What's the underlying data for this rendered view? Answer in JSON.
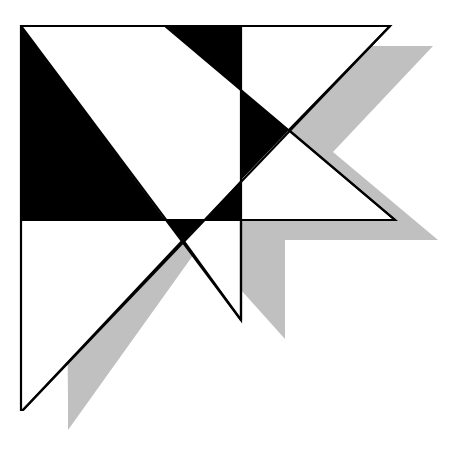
{
  "figure": {
    "width": 467,
    "height": 455,
    "colors": {
      "background": "#ffffff",
      "fill_black": "#000000",
      "shadow": "#c0c0c0",
      "stroke": "#000000"
    },
    "shadow_polygon": "65,46 433,46 333,152 438,240 285,240 285,339 241,290 241,240 204,240 68,430 68,400",
    "outline_polygon": "21,26 390,26 289,130 395,220 241,220 241,320 183,240 23,410 21,410",
    "black_regions": [
      {
        "name": "left-black-region",
        "points": "21,26 165,220 21,220"
      },
      {
        "name": "top-black-triangle",
        "points": "165,26 241,26 241,90"
      },
      {
        "name": "center-black-triangle",
        "points": "241,90 289,130 241,180"
      },
      {
        "name": "lower-black-triangle",
        "points": "241,180 241,220 204,220"
      },
      {
        "name": "bottom-black-bowtie",
        "points": "165,220 204,220 183,242"
      }
    ],
    "lines": [
      {
        "name": "horizontal-divider",
        "x1": 21,
        "y1": 220,
        "x2": 395,
        "y2": 220
      },
      {
        "name": "vertical-divider",
        "x1": 241,
        "y1": 26,
        "x2": 241,
        "y2": 320
      },
      {
        "name": "diagonal-left-down",
        "x1": 21,
        "y1": 26,
        "x2": 241,
        "y2": 320
      },
      {
        "name": "diagonal-long",
        "x1": 23,
        "y1": 410,
        "x2": 390,
        "y2": 26
      },
      {
        "name": "diagonal-top-right",
        "x1": 165,
        "y1": 26,
        "x2": 395,
        "y2": 220
      }
    ]
  }
}
